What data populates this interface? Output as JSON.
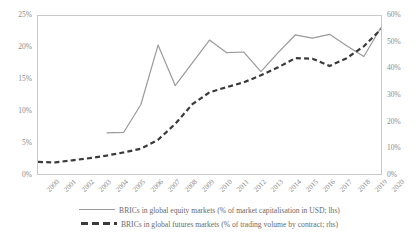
{
  "chart_data": {
    "type": "line",
    "title": "",
    "xlabel": "",
    "ylabel": "",
    "grid": false,
    "legend_position": "bottom",
    "x": [
      2000,
      2001,
      2002,
      2003,
      2004,
      2005,
      2006,
      2007,
      2008,
      2009,
      2010,
      2011,
      2012,
      2013,
      2014,
      2015,
      2016,
      2017,
      2018,
      2019,
      2020
    ],
    "x_tick_labels": [
      "2000",
      "2001",
      "2002",
      "2003",
      "2004",
      "2005",
      "2006",
      "2007",
      "2008",
      "2009",
      "2010",
      "2011",
      "2012",
      "2013",
      "2014",
      "2015",
      "2016",
      "2017",
      "2018",
      "2019",
      "2020"
    ],
    "axes": {
      "left": {
        "label": "",
        "ylim": [
          0,
          25
        ],
        "ticks": [
          0,
          5,
          10,
          15,
          20,
          25
        ],
        "tick_labels": [
          "0%",
          "5%",
          "10%",
          "15%",
          "20%",
          "25%"
        ]
      },
      "right": {
        "label": "",
        "ylim": [
          0,
          60
        ],
        "ticks": [
          0,
          10,
          20,
          30,
          40,
          50,
          60
        ],
        "tick_labels": [
          "0%",
          "10%",
          "20%",
          "30%",
          "40%",
          "50%",
          "60%"
        ]
      }
    },
    "series": [
      {
        "name": "BRICs in global equity markets (% of market capitalisation in USD; lhs)",
        "axis": "left",
        "style": "solid",
        "color": "#9a9a9a",
        "x": [
          2004,
          2005,
          2006,
          2007,
          2008,
          2009,
          2010,
          2011,
          2012,
          2013,
          2014,
          2015,
          2016,
          2017,
          2018,
          2019,
          2020
        ],
        "values": [
          6.5,
          6.6,
          11.0,
          20.4,
          14.0,
          17.6,
          21.2,
          19.2,
          19.3,
          16.2,
          19.2,
          22.0,
          21.5,
          22.1,
          20.3,
          18.6,
          23.2
        ]
      },
      {
        "name": "BRICs in global futures markets (% of trading volume by contract; rhs)",
        "axis": "right",
        "style": "dashed",
        "color": "#3a3a3a",
        "x": [
          2000,
          2001,
          2002,
          2003,
          2004,
          2005,
          2006,
          2007,
          2008,
          2009,
          2010,
          2011,
          2012,
          2013,
          2014,
          2015,
          2016,
          2017,
          2018,
          2019,
          2020
        ],
        "values": [
          4.6,
          4.4,
          5.2,
          6.0,
          7.0,
          8.2,
          9.6,
          13.0,
          19.0,
          26.5,
          31.0,
          33.0,
          34.8,
          37.5,
          40.5,
          44.0,
          43.8,
          41.0,
          44.0,
          48.5,
          55.0
        ]
      }
    ],
    "legend": [
      {
        "label": "BRICs in global equity markets (% of market capitalisation in USD; lhs)",
        "style": "solid",
        "color": "#9a9a9a"
      },
      {
        "label": "BRICs in global futures markets (% of trading volume by contract; rhs)",
        "style": "dashed",
        "color": "#3a3a3a"
      }
    ]
  }
}
